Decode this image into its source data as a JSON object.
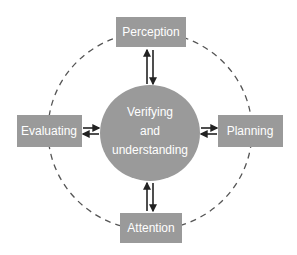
{
  "diagram": {
    "type": "cycle",
    "center": {
      "label_lines": [
        "Verifying",
        "and",
        "understanding"
      ]
    },
    "nodes": [
      {
        "id": "perception",
        "label": "Perception",
        "position": "top"
      },
      {
        "id": "planning",
        "label": "Planning",
        "position": "right"
      },
      {
        "id": "attention",
        "label": "Attention",
        "position": "bottom"
      },
      {
        "id": "evaluating",
        "label": "Evaluating",
        "position": "left"
      }
    ],
    "connections": [
      {
        "from": "center",
        "to": "perception",
        "bidirectional": true
      },
      {
        "from": "center",
        "to": "planning",
        "bidirectional": true
      },
      {
        "from": "center",
        "to": "attention",
        "bidirectional": true
      },
      {
        "from": "center",
        "to": "evaluating",
        "bidirectional": true
      }
    ],
    "ring": {
      "style": "dashed",
      "connects": [
        "perception",
        "planning",
        "attention",
        "evaluating"
      ]
    },
    "colors": {
      "node_fill": "#9a9a9a",
      "text": "#ffffff",
      "arrow": "#222222",
      "ring": "#555555"
    }
  }
}
